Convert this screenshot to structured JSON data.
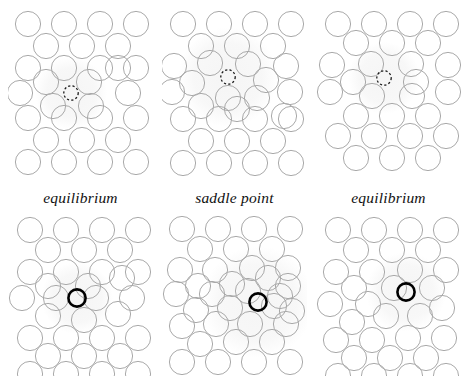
{
  "figure": {
    "width": 469,
    "height": 379,
    "background": "#ffffff"
  },
  "style": {
    "lattice_circle_stroke": "#a9a9a9",
    "lattice_circle_stroke_width": 1,
    "lattice_circle_radius": 12.6,
    "defect_dashed_stroke": "#1a1a1a",
    "defect_dashed_radius": 7.2,
    "defect_dashed_width": 1.3,
    "defect_dash_pattern": "2.2 2.2",
    "bold_circle_stroke": "#000000",
    "bold_circle_radius": 8.6,
    "bold_circle_width": 2.6,
    "halo_fill": "#ededed",
    "halo_opacity": 0.55,
    "label_color": "#111111"
  },
  "labels": {
    "left": "equilibrium",
    "middle": "saddle point",
    "right": "equilibrium"
  },
  "panels": [
    {
      "name": "top-left",
      "row": "top",
      "column": "left",
      "x": 8,
      "y": 6,
      "width": 145,
      "height": 178,
      "state": "equilibrium",
      "marker": "dashed-small-circle",
      "marker_x": 63,
      "marker_y": 87,
      "halo": {
        "cx": 63,
        "cy": 87,
        "r": 36
      },
      "lattice": {
        "kind": "hexagonal",
        "spacing_x": 36,
        "spacing_y": 25,
        "rows": 9,
        "cols": 4
      }
    },
    {
      "name": "top-middle",
      "row": "top",
      "column": "middle",
      "x": 162,
      "y": 6,
      "width": 145,
      "height": 178,
      "state": "saddle point",
      "marker": "dashed-small-circle",
      "marker_x": 66,
      "marker_y": 71,
      "halo": {
        "cx": 66,
        "cy": 71,
        "r": 50
      },
      "lattice": {
        "kind": "hexagonal-distorted",
        "spacing_x": 36,
        "spacing_y": 25,
        "rows": 9,
        "cols": 4
      }
    },
    {
      "name": "top-right",
      "row": "top",
      "column": "right",
      "x": 316,
      "y": 6,
      "width": 145,
      "height": 178,
      "state": "equilibrium",
      "marker": "dashed-small-circle",
      "marker_x": 68,
      "marker_y": 72,
      "halo": {
        "cx": 68,
        "cy": 72,
        "r": 36
      },
      "lattice": {
        "kind": "hexagonal",
        "spacing_x": 36,
        "spacing_y": 25,
        "rows": 9,
        "cols": 4
      }
    },
    {
      "name": "bottom-left",
      "row": "bottom",
      "column": "left",
      "x": 8,
      "y": 216,
      "width": 145,
      "height": 160,
      "state": "equilibrium",
      "marker": "bold-black-circle",
      "marker_x": 69,
      "marker_y": 82,
      "halo": {
        "cx": 69,
        "cy": 82,
        "r": 36
      },
      "lattice": {
        "kind": "hexagonal-relaxed",
        "spacing_x": 36,
        "spacing_y": 25,
        "rows": 9,
        "cols": 4
      }
    },
    {
      "name": "bottom-middle",
      "row": "bottom",
      "column": "middle",
      "x": 162,
      "y": 216,
      "width": 145,
      "height": 160,
      "state": "saddle point",
      "marker": "bold-black-circle",
      "marker_x": 96,
      "marker_y": 86,
      "halo": {
        "cx": 96,
        "cy": 86,
        "r": 56
      },
      "lattice": {
        "kind": "hexagonal-compressed",
        "spacing_x": 33,
        "spacing_y": 23,
        "rows": 9,
        "cols": 4
      }
    },
    {
      "name": "bottom-right",
      "row": "bottom",
      "column": "right",
      "x": 316,
      "y": 216,
      "width": 145,
      "height": 160,
      "state": "equilibrium",
      "marker": "bold-black-circle",
      "marker_x": 90,
      "marker_y": 76,
      "halo": {
        "cx": 90,
        "cy": 76,
        "r": 40
      },
      "lattice": {
        "kind": "hexagonal-relaxed",
        "spacing_x": 36,
        "spacing_y": 25,
        "rows": 9,
        "cols": 4
      }
    }
  ],
  "lattice_sites": {
    "top-left": [
      [
        20,
        18
      ],
      [
        56,
        18
      ],
      [
        92,
        18
      ],
      [
        128,
        18
      ],
      [
        38,
        40
      ],
      [
        74,
        40
      ],
      [
        110,
        40
      ],
      [
        20,
        62
      ],
      [
        56,
        62
      ],
      [
        92,
        62
      ],
      [
        128,
        62
      ],
      [
        38,
        76
      ],
      [
        81,
        76
      ],
      [
        110,
        62
      ],
      [
        12,
        87
      ],
      [
        45,
        100
      ],
      [
        83,
        100
      ],
      [
        120,
        87
      ],
      [
        20,
        112
      ],
      [
        56,
        112
      ],
      [
        92,
        112
      ],
      [
        128,
        112
      ],
      [
        38,
        134
      ],
      [
        74,
        134
      ],
      [
        110,
        134
      ],
      [
        20,
        156
      ],
      [
        56,
        156
      ],
      [
        92,
        156
      ],
      [
        128,
        156
      ]
    ],
    "top-middle": [
      [
        21,
        18
      ],
      [
        57,
        18
      ],
      [
        93,
        18
      ],
      [
        129,
        18
      ],
      [
        39,
        40
      ],
      [
        75,
        40
      ],
      [
        111,
        40
      ],
      [
        12,
        60
      ],
      [
        48,
        57
      ],
      [
        86,
        58
      ],
      [
        124,
        60
      ],
      [
        30,
        77
      ],
      [
        104,
        74
      ],
      [
        128,
        86
      ],
      [
        10,
        86
      ],
      [
        66,
        92
      ],
      [
        95,
        92
      ],
      [
        122,
        110
      ],
      [
        39,
        100
      ],
      [
        75,
        103
      ],
      [
        21,
        113
      ],
      [
        57,
        113
      ],
      [
        93,
        113
      ],
      [
        129,
        113
      ],
      [
        39,
        135
      ],
      [
        75,
        135
      ],
      [
        111,
        135
      ],
      [
        21,
        157
      ],
      [
        57,
        157
      ],
      [
        93,
        157
      ],
      [
        129,
        157
      ]
    ],
    "top-right": [
      [
        22,
        18
      ],
      [
        58,
        18
      ],
      [
        94,
        18
      ],
      [
        130,
        18
      ],
      [
        40,
        37
      ],
      [
        76,
        37
      ],
      [
        112,
        37
      ],
      [
        16,
        59
      ],
      [
        55,
        58
      ],
      [
        95,
        58
      ],
      [
        132,
        59
      ],
      [
        37,
        76
      ],
      [
        100,
        76
      ],
      [
        14,
        86
      ],
      [
        56,
        90
      ],
      [
        96,
        90
      ],
      [
        132,
        86
      ],
      [
        40,
        110
      ],
      [
        76,
        110
      ],
      [
        112,
        110
      ],
      [
        22,
        130
      ],
      [
        58,
        130
      ],
      [
        94,
        130
      ],
      [
        130,
        130
      ],
      [
        40,
        152
      ],
      [
        76,
        152
      ],
      [
        112,
        152
      ]
    ],
    "bottom-left": [
      [
        22,
        14
      ],
      [
        58,
        14
      ],
      [
        94,
        14
      ],
      [
        130,
        14
      ],
      [
        40,
        34
      ],
      [
        76,
        34
      ],
      [
        112,
        34
      ],
      [
        22,
        56
      ],
      [
        58,
        56
      ],
      [
        94,
        56
      ],
      [
        130,
        56
      ],
      [
        40,
        70
      ],
      [
        80,
        70
      ],
      [
        114,
        62
      ],
      [
        14,
        82
      ],
      [
        48,
        82
      ],
      [
        88,
        82
      ],
      [
        124,
        82
      ],
      [
        40,
        100
      ],
      [
        76,
        104
      ],
      [
        110,
        98
      ],
      [
        22,
        122
      ],
      [
        58,
        122
      ],
      [
        94,
        122
      ],
      [
        130,
        122
      ],
      [
        40,
        140
      ],
      [
        76,
        140
      ],
      [
        112,
        140
      ],
      [
        22,
        158
      ],
      [
        58,
        158
      ],
      [
        94,
        158
      ],
      [
        130,
        158
      ]
    ],
    "bottom-middle": [
      [
        20,
        13
      ],
      [
        56,
        13
      ],
      [
        92,
        13
      ],
      [
        128,
        13
      ],
      [
        38,
        33
      ],
      [
        74,
        33
      ],
      [
        110,
        33
      ],
      [
        18,
        54
      ],
      [
        53,
        54
      ],
      [
        90,
        52
      ],
      [
        126,
        52
      ],
      [
        36,
        70
      ],
      [
        70,
        68
      ],
      [
        106,
        62
      ],
      [
        126,
        70
      ],
      [
        14,
        78
      ],
      [
        50,
        78
      ],
      [
        86,
        75
      ],
      [
        118,
        80
      ],
      [
        34,
        94
      ],
      [
        68,
        92
      ],
      [
        112,
        90
      ],
      [
        130,
        95
      ],
      [
        20,
        110
      ],
      [
        54,
        108
      ],
      [
        88,
        108
      ],
      [
        124,
        108
      ],
      [
        38,
        128
      ],
      [
        74,
        126
      ],
      [
        110,
        126
      ],
      [
        20,
        146
      ],
      [
        56,
        146
      ],
      [
        92,
        146
      ],
      [
        128,
        146
      ]
    ],
    "bottom-right": [
      [
        22,
        14
      ],
      [
        58,
        14
      ],
      [
        94,
        14
      ],
      [
        130,
        14
      ],
      [
        40,
        34
      ],
      [
        76,
        34
      ],
      [
        112,
        34
      ],
      [
        20,
        56
      ],
      [
        56,
        56
      ],
      [
        94,
        54
      ],
      [
        130,
        54
      ],
      [
        38,
        72
      ],
      [
        78,
        72
      ],
      [
        116,
        72
      ],
      [
        14,
        88
      ],
      [
        52,
        88
      ],
      [
        126,
        92
      ],
      [
        36,
        106
      ],
      [
        70,
        100
      ],
      [
        104,
        100
      ],
      [
        20,
        124
      ],
      [
        56,
        124
      ],
      [
        92,
        122
      ],
      [
        128,
        122
      ],
      [
        38,
        142
      ],
      [
        74,
        142
      ],
      [
        110,
        142
      ],
      [
        22,
        160
      ],
      [
        58,
        160
      ],
      [
        94,
        160
      ],
      [
        130,
        160
      ]
    ]
  }
}
